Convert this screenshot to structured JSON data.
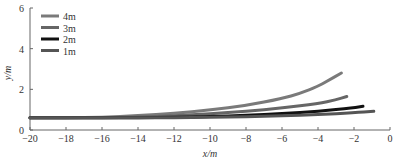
{
  "chart_data": {
    "type": "line",
    "title": "",
    "xlabel": "x/m",
    "ylabel": "y/m",
    "xlim": [
      -20,
      0
    ],
    "ylim": [
      0,
      6
    ],
    "xticks": [
      -20,
      -18,
      -16,
      -14,
      -12,
      -10,
      -8,
      -6,
      -4,
      -2,
      0
    ],
    "yticks": [
      0,
      2,
      4,
      6
    ],
    "grid": false,
    "legend_position": "upper-left",
    "series": [
      {
        "name": "4m",
        "color": "#7a7a7a",
        "width": 3,
        "x": [
          -20,
          -18,
          -16,
          -14,
          -12,
          -10,
          -8,
          -6,
          -5,
          -4,
          -3.5,
          -2.7
        ],
        "y": [
          0.6,
          0.6,
          0.62,
          0.7,
          0.82,
          0.98,
          1.2,
          1.55,
          1.8,
          2.15,
          2.4,
          2.8
        ]
      },
      {
        "name": "3m",
        "color": "#666666",
        "width": 3,
        "x": [
          -20,
          -18,
          -16,
          -14,
          -12,
          -10,
          -8,
          -6,
          -4,
          -3,
          -2.4
        ],
        "y": [
          0.6,
          0.6,
          0.6,
          0.64,
          0.7,
          0.8,
          0.92,
          1.08,
          1.3,
          1.48,
          1.65
        ]
      },
      {
        "name": "2m",
        "color": "#111111",
        "width": 3,
        "x": [
          -20,
          -18,
          -16,
          -14,
          -12,
          -10,
          -8,
          -6,
          -4,
          -2,
          -1.5
        ],
        "y": [
          0.6,
          0.6,
          0.6,
          0.6,
          0.62,
          0.66,
          0.72,
          0.8,
          0.92,
          1.1,
          1.17
        ]
      },
      {
        "name": "1m",
        "color": "#555555",
        "width": 3,
        "x": [
          -20,
          -18,
          -16,
          -14,
          -12,
          -10,
          -8,
          -6,
          -4,
          -2,
          -0.9
        ],
        "y": [
          0.6,
          0.6,
          0.6,
          0.6,
          0.6,
          0.62,
          0.65,
          0.7,
          0.76,
          0.85,
          0.92
        ]
      }
    ]
  },
  "legend": [
    {
      "label": "4m",
      "color": "#7a7a7a"
    },
    {
      "label": "3m",
      "color": "#666666"
    },
    {
      "label": "2m",
      "color": "#111111"
    },
    {
      "label": "1m",
      "color": "#555555"
    }
  ],
  "axes": {
    "xlabel": "x/m",
    "ylabel": "y/m"
  }
}
